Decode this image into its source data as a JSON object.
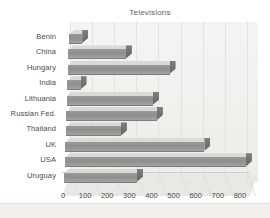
{
  "chart_data": {
    "type": "bar",
    "orientation": "horizontal",
    "title": "Televisions",
    "xlabel": "",
    "ylabel": "",
    "categories": [
      "Benin",
      "China",
      "Hungary",
      "India",
      "Lithuania",
      "Russian Fed.",
      "Thailand",
      "UK",
      "USA",
      "Uruguay"
    ],
    "values": [
      60,
      260,
      460,
      60,
      390,
      410,
      250,
      630,
      820,
      330
    ],
    "xlim": [
      0,
      850
    ],
    "xticks": [
      0,
      100,
      200,
      300,
      400,
      500,
      600,
      700,
      800
    ],
    "xtick_labels": [
      "0",
      "100",
      "200",
      "300",
      "400",
      "500",
      "600",
      "700",
      "800"
    ],
    "grid": true,
    "grid_axis": "x",
    "legend": false,
    "style": "3d-bar",
    "bar_color": "#8e8e8e",
    "bar_top_color": "#d9d9d7",
    "plot_background": "#efefee"
  },
  "colors": {
    "background": "#ffffff",
    "plot_area": "#efefee",
    "gridline": "#e2e2e0",
    "bar_front": "#8e8e8e",
    "bar_top": "#d9d9d7",
    "bar_cap": "#6f6f6f",
    "text": "#4a4a4a",
    "title_text": "#5e5e5e",
    "page_band": "#f2f0ee"
  }
}
